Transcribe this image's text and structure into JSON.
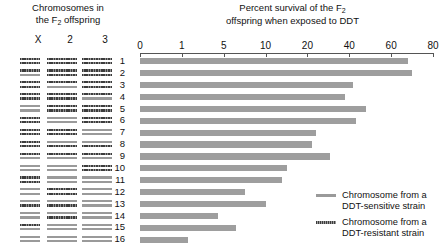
{
  "left_panel": {
    "title_line1": "Chromosomes in",
    "title_line2_pre": "the F",
    "title_line2_sub": "2",
    "title_line2_post": " offspring",
    "column_headers": [
      "X",
      "2",
      "3"
    ]
  },
  "chart_title": {
    "line1_pre": "Percent survival of the F",
    "line1_sub": "2",
    "line2": "offspring when exposed to DDT"
  },
  "legend": [
    {
      "label_line1": "Chromosome from a",
      "label_line2": "DDT-sensitive strain",
      "style": "light",
      "color": "#9a9a9a"
    },
    {
      "label_line1": "Chromosome from a",
      "label_line2": "DDT-resistant strain",
      "style": "dark",
      "color": "#3c3c3c"
    }
  ],
  "chart_data": {
    "type": "bar",
    "orientation": "horizontal",
    "title": "Percent survival of the F2 offspring when exposed to DDT",
    "xlabel": "",
    "ylabel": "",
    "grid": false,
    "legend_position": "bottom-right",
    "axis_scale": "nonlinear-evenly-spaced-ticks",
    "tick_labels": [
      "0",
      "1",
      "5",
      "10",
      "20",
      "40",
      "60",
      "80"
    ],
    "tick_values": [
      0,
      1,
      5,
      10,
      20,
      40,
      60,
      80
    ],
    "xlim": [
      0,
      80
    ],
    "categories": [
      "1",
      "2",
      "3",
      "4",
      "5",
      "6",
      "7",
      "8",
      "9",
      "10",
      "11",
      "12",
      "13",
      "14",
      "15",
      "16"
    ],
    "values": [
      68,
      70,
      42,
      38,
      48,
      43,
      24,
      22,
      31,
      15,
      14,
      7.5,
      10,
      4.5,
      6.5,
      1.6
    ],
    "bar_color": "#9e9e9e",
    "rows": [
      {
        "id": "1",
        "percent_survival": 68,
        "chromosomes": {
          "X": [
            "dark",
            "dark"
          ],
          "2": [
            "dark",
            "dark"
          ],
          "3": [
            "dark",
            "dark"
          ]
        }
      },
      {
        "id": "2",
        "percent_survival": 70,
        "chromosomes": {
          "X": [
            "dark",
            "light"
          ],
          "2": [
            "dark",
            "dark"
          ],
          "3": [
            "dark",
            "dark"
          ]
        }
      },
      {
        "id": "3",
        "percent_survival": 42,
        "chromosomes": {
          "X": [
            "dark",
            "dark"
          ],
          "2": [
            "dark",
            "light"
          ],
          "3": [
            "dark",
            "dark"
          ]
        }
      },
      {
        "id": "4",
        "percent_survival": 38,
        "chromosomes": {
          "X": [
            "dark",
            "dark"
          ],
          "2": [
            "dark",
            "dark"
          ],
          "3": [
            "dark",
            "light"
          ]
        }
      },
      {
        "id": "5",
        "percent_survival": 48,
        "chromosomes": {
          "X": [
            "light",
            "light"
          ],
          "2": [
            "dark",
            "dark"
          ],
          "3": [
            "dark",
            "dark"
          ]
        }
      },
      {
        "id": "6",
        "percent_survival": 43,
        "chromosomes": {
          "X": [
            "dark",
            "dark"
          ],
          "2": [
            "light",
            "light"
          ],
          "3": [
            "dark",
            "dark"
          ]
        }
      },
      {
        "id": "7",
        "percent_survival": 24,
        "chromosomes": {
          "X": [
            "dark",
            "dark"
          ],
          "2": [
            "dark",
            "dark"
          ],
          "3": [
            "light",
            "light"
          ]
        }
      },
      {
        "id": "8",
        "percent_survival": 22,
        "chromosomes": {
          "X": [
            "dark",
            "dark"
          ],
          "2": [
            "light",
            "dark"
          ],
          "3": [
            "light",
            "dark"
          ]
        }
      },
      {
        "id": "9",
        "percent_survival": 31,
        "chromosomes": {
          "X": [
            "dark",
            "light"
          ],
          "2": [
            "dark",
            "light"
          ],
          "3": [
            "dark",
            "light"
          ]
        }
      },
      {
        "id": "10",
        "percent_survival": 15,
        "chromosomes": {
          "X": [
            "light",
            "light"
          ],
          "2": [
            "light",
            "light"
          ],
          "3": [
            "dark",
            "dark"
          ]
        }
      },
      {
        "id": "11",
        "percent_survival": 14,
        "chromosomes": {
          "X": [
            "dark",
            "dark"
          ],
          "2": [
            "light",
            "light"
          ],
          "3": [
            "light",
            "light"
          ]
        }
      },
      {
        "id": "12",
        "percent_survival": 7.5,
        "chromosomes": {
          "X": [
            "light",
            "light"
          ],
          "2": [
            "dark",
            "dark"
          ],
          "3": [
            "light",
            "light"
          ]
        }
      },
      {
        "id": "13",
        "percent_survival": 10,
        "chromosomes": {
          "X": [
            "light",
            "dark"
          ],
          "2": [
            "light",
            "dark"
          ],
          "3": [
            "light",
            "light"
          ]
        }
      },
      {
        "id": "14",
        "percent_survival": 4.5,
        "chromosomes": {
          "X": [
            "light",
            "light"
          ],
          "2": [
            "light",
            "dark"
          ],
          "3": [
            "light",
            "light"
          ]
        }
      },
      {
        "id": "15",
        "percent_survival": 6.5,
        "chromosomes": {
          "X": [
            "dark",
            "light"
          ],
          "2": [
            "light",
            "light"
          ],
          "3": [
            "light",
            "light"
          ]
        }
      },
      {
        "id": "16",
        "percent_survival": 1.6,
        "chromosomes": {
          "X": [
            "light",
            "light"
          ],
          "2": [
            "light",
            "light"
          ],
          "3": [
            "light",
            "light"
          ]
        }
      }
    ]
  }
}
